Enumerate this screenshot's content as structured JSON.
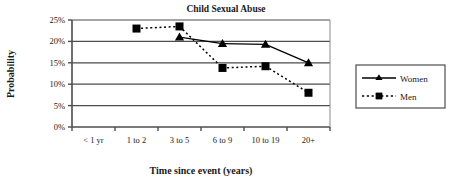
{
  "chart_data": {
    "type": "line",
    "title": "Child Sexual Abuse",
    "xlabel": "Time since event (years)",
    "ylabel": "Probability",
    "categories": [
      "< 1 yr",
      "1 to 2",
      "3 to 5",
      "6 to 9",
      "10 to 19",
      "20+"
    ],
    "ytick_labels": [
      "0%",
      "5%",
      "10%",
      "15%",
      "20%",
      "25%"
    ],
    "ytick_values": [
      0,
      5,
      10,
      15,
      20,
      25
    ],
    "ylim": [
      0,
      25
    ],
    "grid": "horizontal",
    "legend_position": "right-outside",
    "series": [
      {
        "name": "Women",
        "marker": "triangle",
        "line_style": "solid",
        "color": "#000000",
        "values": [
          null,
          null,
          21.0,
          19.5,
          19.3,
          15.0
        ]
      },
      {
        "name": "Men",
        "marker": "square",
        "line_style": "dotted",
        "color": "#000000",
        "values": [
          null,
          23.0,
          23.5,
          13.8,
          14.2,
          8.0
        ]
      }
    ]
  },
  "legend": {
    "entries": [
      {
        "label": "Women"
      },
      {
        "label": "Men"
      }
    ]
  },
  "icons": {
    "triangle_marker": "triangle-marker-icon",
    "square_marker": "square-marker-icon"
  }
}
